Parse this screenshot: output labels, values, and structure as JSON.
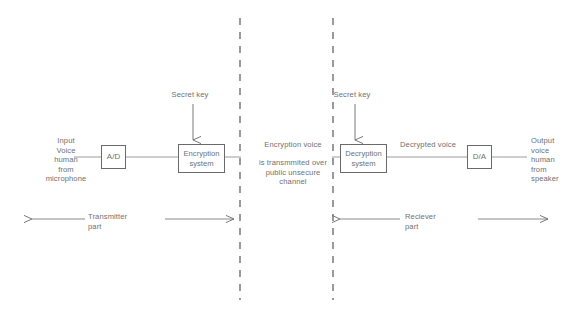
{
  "diagram": {
    "stroke_color": "#6a6a6a",
    "text_color": "#6f6f6f",
    "background": "#ffffff",
    "blocks": [
      {
        "id": "ad",
        "label": "A/D",
        "name": "analog-to-digital-block"
      },
      {
        "id": "enc",
        "label": "Encryption\nsystem",
        "name": "encryption-system-block"
      },
      {
        "id": "dec",
        "label": "Decryption\nsystem",
        "name": "decryption-system-block"
      },
      {
        "id": "da",
        "label": "D/A",
        "name": "digital-to-analog-block"
      }
    ],
    "labels": {
      "input_source": "Input\nVoice\nhuman\nfrom\nmicrophone",
      "output_sink": "Output\nvoice\nhuman\nfrom\nspeaker",
      "secret_key_left": "Secret key",
      "secret_key_right": "Secret key",
      "encryption_voice": "Encryption voice",
      "channel": "is transmmited over\npublic unsecure\nchannel",
      "decrypted_voice": "Decrypted voice",
      "transmitter_part": "Transmitter\npart",
      "reciever_part": "Reciever\npart"
    },
    "dividers": [
      {
        "name": "left-boundary-dashed-line",
        "x": 240,
        "y1": 18,
        "y2": 300
      },
      {
        "name": "right-boundary-dashed-line",
        "x": 333,
        "y1": 18,
        "y2": 300
      }
    ]
  }
}
